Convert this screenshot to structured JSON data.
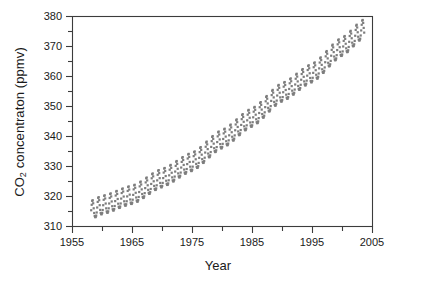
{
  "chart_data": {
    "type": "scatter",
    "title": "",
    "xlabel": "Year",
    "ylabel": "CO2 concentraton (ppmv)",
    "ylabel_prefix": "CO",
    "ylabel_sub": "2",
    "ylabel_suffix": " concentraton (ppmv)",
    "xlim": [
      1955,
      2005
    ],
    "ylim": [
      310,
      380
    ],
    "xticks": [
      1955,
      1965,
      1975,
      1985,
      1995,
      2005
    ],
    "xtick_labels": [
      "1955",
      "1965",
      "1975",
      "1985",
      "1995",
      "2005"
    ],
    "xminor_ticks": [
      1960,
      1970,
      1980,
      1990,
      2000
    ],
    "yticks": [
      310,
      320,
      330,
      340,
      350,
      360,
      370,
      380
    ],
    "ytick_labels": [
      "310",
      "320",
      "330",
      "340",
      "350",
      "360",
      "370",
      "380"
    ],
    "yminor_ticks": [
      315,
      325,
      335,
      345,
      355,
      365,
      375
    ],
    "grid": false,
    "legend": null,
    "marker": {
      "shape": "square",
      "size_px": 2.2,
      "color": "#7d7d7d"
    },
    "frame_color": "#3c3c3c",
    "background": "#ffffff",
    "series_name": "Mauna Loa monthly mean CO2",
    "data_start_year": 1958.2,
    "data_end_year": 2003.7,
    "samples_per_year": 12,
    "seasonal_amplitude_ppmv": 3.1,
    "seasonal_peak_month": 5,
    "trend_description": "quadratic rise from about 315 ppmv in 1958 to about 375 ppmv in 2003",
    "trend_anchor_points": [
      {
        "year": 1958.2,
        "value": 315.0
      },
      {
        "year": 1960.0,
        "value": 316.6
      },
      {
        "year": 1965.0,
        "value": 320.0
      },
      {
        "year": 1970.0,
        "value": 325.6
      },
      {
        "year": 1975.0,
        "value": 331.0
      },
      {
        "year": 1980.0,
        "value": 338.6
      },
      {
        "year": 1985.0,
        "value": 345.8
      },
      {
        "year": 1990.0,
        "value": 354.2
      },
      {
        "year": 1995.0,
        "value": 360.6
      },
      {
        "year": 2000.0,
        "value": 369.4
      },
      {
        "year": 2003.7,
        "value": 375.5
      }
    ],
    "observed_min_ppmv": 313.2,
    "observed_max_ppmv": 377.0
  },
  "geometry": {
    "plot_left": 72,
    "plot_right": 372,
    "plot_top": 16,
    "plot_bottom": 226
  }
}
